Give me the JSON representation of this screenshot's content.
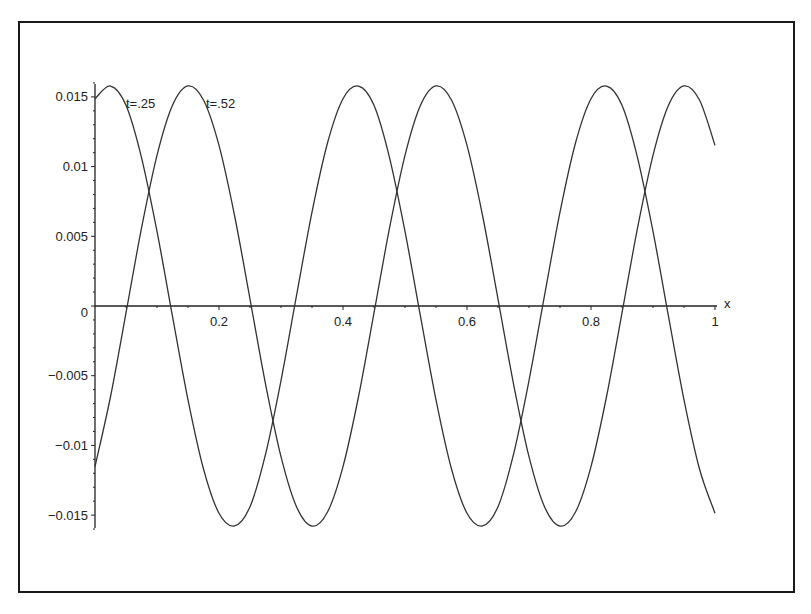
{
  "chart_data": {
    "type": "line",
    "title": "",
    "xlabel": "x",
    "ylabel": "",
    "xlim": [
      0,
      1
    ],
    "ylim": [
      -0.0165,
      0.0165
    ],
    "grid": false,
    "legend": "inline labels",
    "x_ticks": [
      0.2,
      0.4,
      0.6,
      0.8,
      1
    ],
    "x_tick_labels": [
      "0.2",
      "0.4",
      "0.6",
      "0.8",
      "1"
    ],
    "y_ticks": [
      0.015,
      0.01,
      0.005,
      0,
      -0.005,
      -0.01,
      -0.015
    ],
    "y_tick_labels": [
      "0.015",
      "0.01",
      "0.005",
      "0",
      "−0.005",
      "−0.01",
      "−0.015"
    ],
    "x": [
      0,
      0.025,
      0.05,
      0.075,
      0.1,
      0.125,
      0.15,
      0.175,
      0.2,
      0.225,
      0.25,
      0.275,
      0.3,
      0.325,
      0.35,
      0.375,
      0.4,
      0.425,
      0.45,
      0.475,
      0.5,
      0.525,
      0.55,
      0.575,
      0.6,
      0.625,
      0.65,
      0.675,
      0.7,
      0.725,
      0.75,
      0.775,
      0.8,
      0.825,
      0.85,
      0.875,
      0.9,
      0.925,
      0.95,
      0.975,
      1
    ],
    "series": [
      {
        "name": "t=.25",
        "label_pos": [
          0.05,
          0.0145
        ],
        "values": [
          0.01487,
          0.01578,
          0.0144,
          0.01065,
          0.00535,
          -0.00074,
          -0.00673,
          -0.01169,
          -0.01487,
          -0.01578,
          -0.0144,
          -0.01065,
          -0.00535,
          0.00074,
          0.00673,
          0.01169,
          0.01487,
          0.01578,
          0.0144,
          0.01065,
          0.00535,
          -0.00074,
          -0.00673,
          -0.01169,
          -0.01487,
          -0.01578,
          -0.0144,
          -0.01065,
          -0.00535,
          0.00074,
          0.00673,
          0.01169,
          0.01487,
          0.01578,
          0.0144,
          0.01065,
          0.00535,
          -0.00074,
          -0.00673,
          -0.01169,
          -0.01487
        ]
      },
      {
        "name": "t=.52",
        "label_pos": [
          0.179,
          0.0145
        ],
        "values": [
          -0.01152,
          -0.00651,
          -0.0005,
          0.00558,
          0.01081,
          0.0144,
          0.01579,
          0.01478,
          0.01152,
          0.00651,
          0.0005,
          -0.00558,
          -0.01081,
          -0.0144,
          -0.01579,
          -0.01478,
          -0.01152,
          -0.00651,
          -0.0005,
          0.00558,
          0.01081,
          0.0144,
          0.01579,
          0.01478,
          0.01152,
          0.00651,
          0.0005,
          -0.00558,
          -0.01081,
          -0.0144,
          -0.01579,
          -0.01478,
          -0.01152,
          -0.00651,
          -0.0005,
          0.00558,
          0.01081,
          0.0144,
          0.01579,
          0.01478,
          0.01152
        ]
      }
    ],
    "colors": {
      "axis": "#222222",
      "curve": "#333333",
      "frame": "#1a1a1a"
    }
  }
}
